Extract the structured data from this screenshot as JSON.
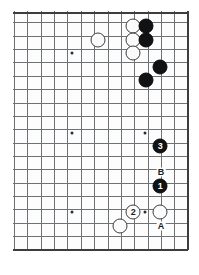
{
  "figure": {
    "kind": "go-board-diagram",
    "board_size": 19,
    "visible_columns": 14,
    "visible_rows": 18,
    "line_color": "#6f7275",
    "edge_color": "#3b3d3f",
    "black_color": "#111214",
    "white_color": "#fbfbfb",
    "background": "#ffffff"
  },
  "geometry": {
    "origin_x": 13,
    "origin_y": 11,
    "width": 175,
    "height": 239,
    "spacing": 13.35,
    "right_edge_x": 174,
    "bottom_edge_y": 238,
    "top_edge_y": 1
  },
  "grid": {
    "columns_x": [
      1,
      14.4,
      27.7,
      41.1,
      54.4,
      67.8,
      81.1,
      94.5,
      107.8,
      121.2,
      134.5,
      147.9,
      161.2,
      174
    ],
    "rows_y": [
      1,
      11.4,
      24.7,
      38.1,
      51.4,
      64.8,
      78.1,
      91.5,
      104.8,
      118.2,
      131.5,
      144.9,
      158.2,
      171.6,
      184.9,
      198.3,
      211.6,
      225,
      238
    ]
  },
  "star_points": [
    {
      "name": "star-upper-left",
      "x": 59,
      "y": 42
    },
    {
      "name": "star-center-left",
      "x": 59,
      "y": 122
    },
    {
      "name": "star-lower-left",
      "x": 59,
      "y": 201
    },
    {
      "name": "star-center-right",
      "x": 132,
      "y": 122
    },
    {
      "name": "star-lower-right",
      "x": 132,
      "y": 201
    }
  ],
  "stones": [
    {
      "id": "w-a",
      "color": "white",
      "label": "",
      "x": 120,
      "y": 15
    },
    {
      "id": "b-a",
      "color": "black",
      "label": "",
      "x": 133,
      "y": 15
    },
    {
      "id": "w-b",
      "color": "white",
      "label": "",
      "x": 120,
      "y": 29
    },
    {
      "id": "b-b",
      "color": "black",
      "label": "",
      "x": 133,
      "y": 29
    },
    {
      "id": "w-c",
      "color": "white",
      "label": "",
      "x": 120,
      "y": 42
    },
    {
      "id": "w-d",
      "color": "white",
      "label": "",
      "x": 85,
      "y": 29
    },
    {
      "id": "b-c",
      "color": "black",
      "label": "",
      "x": 147,
      "y": 56
    },
    {
      "id": "b-d",
      "color": "black",
      "label": "",
      "x": 133,
      "y": 69
    },
    {
      "id": "b-move-3",
      "color": "black",
      "label": "3",
      "x": 147,
      "y": 135
    },
    {
      "id": "b-move-1",
      "color": "black",
      "label": "1",
      "x": 147,
      "y": 175
    },
    {
      "id": "w-move-2",
      "color": "white",
      "label": "2",
      "x": 120,
      "y": 201
    },
    {
      "id": "w-e",
      "color": "white",
      "label": "",
      "x": 147,
      "y": 201
    },
    {
      "id": "w-f",
      "color": "white",
      "label": "",
      "x": 107,
      "y": 215
    }
  ],
  "point_labels": [
    {
      "id": "label-b",
      "text": "B",
      "x": 148,
      "y": 161
    },
    {
      "id": "label-a",
      "text": "A",
      "x": 148,
      "y": 215
    }
  ]
}
